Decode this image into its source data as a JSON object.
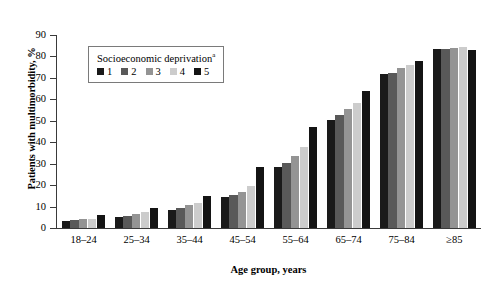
{
  "chart_data": {
    "type": "bar",
    "title": "",
    "xlabel": "Age group, years",
    "ylabel": "Patients with multimorbidity, %",
    "categories": [
      "18–24",
      "25–34",
      "35–44",
      "45–54",
      "55–64",
      "65–74",
      "75–84",
      "≥85"
    ],
    "ylim": [
      0,
      90
    ],
    "yticks": [
      0,
      10,
      20,
      30,
      40,
      50,
      60,
      70,
      80,
      90
    ],
    "ytick_labels": [
      "0",
      "10",
      "20",
      "30",
      "40",
      "50",
      "60",
      "70",
      "80",
      "90"
    ],
    "grid": false,
    "legend_position": "upper-left-inside",
    "legend_title": "Socioeconomic deprivation",
    "legend_title_superscript": "a",
    "series": [
      {
        "name": "1",
        "color": "#1a1a1a",
        "values": [
          3.5,
          5.0,
          8.5,
          14.5,
          28.5,
          50.5,
          72.0,
          83.5
        ]
      },
      {
        "name": "2",
        "color": "#595959",
        "values": [
          3.8,
          5.8,
          9.5,
          15.5,
          30.5,
          52.5,
          72.5,
          83.5
        ]
      },
      {
        "name": "3",
        "color": "#949494",
        "values": [
          4.0,
          6.5,
          10.5,
          17.0,
          33.5,
          55.5,
          74.5,
          84.0
        ]
      },
      {
        "name": "4",
        "color": "#cccccc",
        "values": [
          4.3,
          7.5,
          11.5,
          19.5,
          38.0,
          58.5,
          76.0,
          84.5
        ]
      },
      {
        "name": "5",
        "color": "#141414",
        "values": [
          6.0,
          9.5,
          15.0,
          28.5,
          47.0,
          64.0,
          78.0,
          83.0
        ]
      }
    ]
  }
}
